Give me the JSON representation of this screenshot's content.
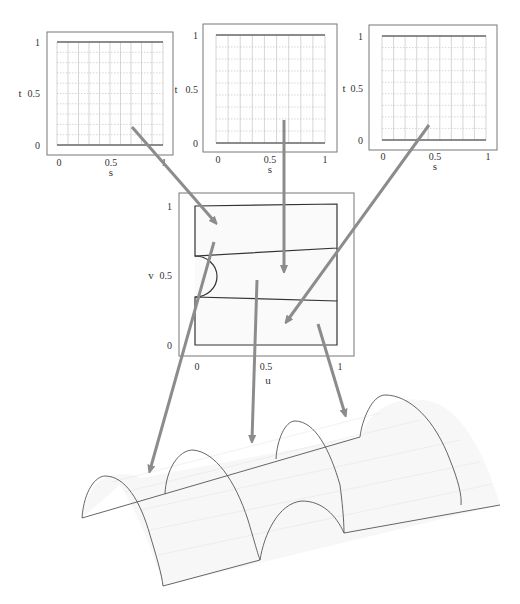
{
  "figure": {
    "param_panels": [
      {
        "id": "patch-1",
        "xlabel": "s",
        "ylabel": "t",
        "xticks": [
          "0",
          "0.5",
          "1"
        ],
        "yticks": [
          "0",
          "0.5",
          "1"
        ]
      },
      {
        "id": "patch-2",
        "xlabel": "s",
        "ylabel": "t",
        "xticks": [
          "0",
          "0.5",
          "1"
        ],
        "yticks": [
          "0",
          "0.5",
          "1"
        ]
      },
      {
        "id": "patch-3",
        "xlabel": "s",
        "ylabel": "t",
        "xticks": [
          "0",
          "0.5",
          "1"
        ],
        "yticks": [
          "0",
          "0.5",
          "1"
        ]
      }
    ],
    "domain_panel": {
      "xlabel": "u",
      "ylabel": "v",
      "xticks": [
        "0",
        "0.5",
        "1"
      ],
      "yticks": [
        "0",
        "0.5",
        "1"
      ],
      "regions": [
        {
          "name": "top-region",
          "polygon_uv": [
            [
              0,
              1
            ],
            [
              1,
              1
            ],
            [
              1,
              0.7
            ],
            [
              0,
              0.65
            ]
          ]
        },
        {
          "name": "middle-region",
          "polygon_uv": [
            [
              0,
              0.65
            ],
            [
              1,
              0.7
            ],
            [
              1,
              0.32
            ],
            [
              0,
              0.35
            ]
          ],
          "notch": "semicircle at u=0 between v=0.35 and v=0.65"
        },
        {
          "name": "bottom-region",
          "polygon_uv": [
            [
              0,
              0.35
            ],
            [
              1,
              0.32
            ],
            [
              1,
              0
            ],
            [
              0,
              0
            ]
          ]
        }
      ]
    },
    "surface": {
      "label": "3D trimmed surface",
      "description": "Half-cylinder vault with semicircular arch cut-outs"
    },
    "arrows": [
      {
        "from": "patch-1",
        "to": "domain top-region"
      },
      {
        "from": "patch-2",
        "to": "domain middle-region"
      },
      {
        "from": "patch-3",
        "to": "domain bottom-region"
      },
      {
        "from": "domain top-region",
        "to": "surface left section"
      },
      {
        "from": "domain middle-region",
        "to": "surface middle section"
      },
      {
        "from": "domain bottom-region",
        "to": "surface right section"
      }
    ],
    "colors": {
      "arrow": "#8c8c8c",
      "frame": "#777777",
      "boundary": "#333333",
      "grid": "#bbbbbb"
    }
  }
}
